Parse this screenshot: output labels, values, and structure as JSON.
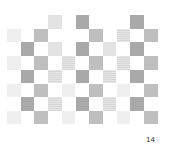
{
  "page": {
    "page_number": "14"
  },
  "pattern": {
    "origin_x": 7,
    "origin_y": 15,
    "cell_step": 13.7,
    "columns": 11,
    "rows": 8,
    "colors": {
      "dark": "#a9a9a9",
      "mid": "#bfbfbf",
      "light": "#e3e3e3",
      "vlight": "#efefef",
      "striped": "#dedede"
    },
    "cells": [
      {
        "row": 0,
        "col": 3,
        "tone": "light"
      },
      {
        "row": 0,
        "col": 5,
        "tone": "dark"
      },
      {
        "row": 0,
        "col": 9,
        "tone": "dark"
      },
      {
        "row": 1,
        "col": 0,
        "tone": "vlight"
      },
      {
        "row": 1,
        "col": 2,
        "tone": "mid"
      },
      {
        "row": 1,
        "col": 6,
        "tone": "mid"
      },
      {
        "row": 1,
        "col": 8,
        "tone": "striped"
      },
      {
        "row": 1,
        "col": 10,
        "tone": "mid"
      },
      {
        "row": 2,
        "col": 1,
        "tone": "dark"
      },
      {
        "row": 2,
        "col": 3,
        "tone": "light"
      },
      {
        "row": 2,
        "col": 5,
        "tone": "dark"
      },
      {
        "row": 2,
        "col": 7,
        "tone": "light"
      },
      {
        "row": 2,
        "col": 9,
        "tone": "dark"
      },
      {
        "row": 3,
        "col": 0,
        "tone": "vlight"
      },
      {
        "row": 3,
        "col": 2,
        "tone": "mid"
      },
      {
        "row": 3,
        "col": 4,
        "tone": "striped"
      },
      {
        "row": 3,
        "col": 6,
        "tone": "mid"
      },
      {
        "row": 3,
        "col": 8,
        "tone": "striped"
      },
      {
        "row": 3,
        "col": 10,
        "tone": "mid"
      },
      {
        "row": 4,
        "col": 1,
        "tone": "dark"
      },
      {
        "row": 4,
        "col": 3,
        "tone": "striped"
      },
      {
        "row": 4,
        "col": 5,
        "tone": "dark"
      },
      {
        "row": 4,
        "col": 7,
        "tone": "striped"
      },
      {
        "row": 4,
        "col": 9,
        "tone": "dark"
      },
      {
        "row": 5,
        "col": 0,
        "tone": "vlight"
      },
      {
        "row": 5,
        "col": 2,
        "tone": "mid"
      },
      {
        "row": 5,
        "col": 4,
        "tone": "vlight"
      },
      {
        "row": 5,
        "col": 6,
        "tone": "mid"
      },
      {
        "row": 5,
        "col": 8,
        "tone": "vlight"
      },
      {
        "row": 5,
        "col": 10,
        "tone": "mid"
      },
      {
        "row": 6,
        "col": 1,
        "tone": "dark"
      },
      {
        "row": 6,
        "col": 3,
        "tone": "striped"
      },
      {
        "row": 6,
        "col": 5,
        "tone": "dark"
      },
      {
        "row": 6,
        "col": 7,
        "tone": "striped"
      },
      {
        "row": 6,
        "col": 9,
        "tone": "dark"
      },
      {
        "row": 7,
        "col": 0,
        "tone": "vlight"
      },
      {
        "row": 7,
        "col": 2,
        "tone": "mid"
      },
      {
        "row": 7,
        "col": 4,
        "tone": "vlight"
      },
      {
        "row": 7,
        "col": 6,
        "tone": "mid"
      },
      {
        "row": 7,
        "col": 8,
        "tone": "vlight"
      },
      {
        "row": 7,
        "col": 10,
        "tone": "mid"
      }
    ]
  }
}
